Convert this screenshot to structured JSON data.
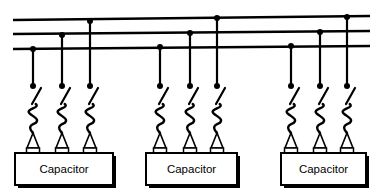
{
  "diagram": {
    "type": "electrical-schematic",
    "canvas": {
      "width": 376,
      "height": 194,
      "background": "#ffffff"
    },
    "stroke_color": "#000000",
    "fill_color": "#ffffff"
  },
  "bus": {
    "name": "three-phase-bus",
    "phase_count": 3,
    "x_start": 13,
    "x_end": 370,
    "lines": [
      {
        "label": "phase-a-line",
        "index": 0,
        "y_left": 20,
        "y_right": 16
      },
      {
        "label": "phase-b-line",
        "index": 1,
        "y_left": 34,
        "y_right": 31
      },
      {
        "label": "phase-c-line",
        "index": 2,
        "y_left": 49,
        "y_right": 46
      }
    ]
  },
  "groups": [
    {
      "id": "group-left",
      "label": "Capacitor",
      "box": {
        "x": 15,
        "y": 153,
        "width": 98,
        "height": 32,
        "shadow_offset": 3
      },
      "drops": [
        {
          "phase": "phase-c",
          "bus_index": 2,
          "x": 33,
          "bus_y": 49,
          "end_y": 86
        },
        {
          "phase": "phase-b",
          "bus_index": 1,
          "x": 62,
          "bus_y": 35,
          "end_y": 86
        },
        {
          "phase": "phase-a",
          "bus_index": 0,
          "x": 90,
          "bus_y": 21,
          "end_y": 86
        }
      ],
      "bushing_x": [
        33,
        62,
        90
      ]
    },
    {
      "id": "group-middle",
      "label": "Capacitor",
      "box": {
        "x": 146,
        "y": 153,
        "width": 91,
        "height": 32,
        "shadow_offset": 3
      },
      "drops": [
        {
          "phase": "phase-c",
          "bus_index": 2,
          "x": 160,
          "bus_y": 47,
          "end_y": 86
        },
        {
          "phase": "phase-b",
          "bus_index": 1,
          "x": 190,
          "bus_y": 33,
          "end_y": 86
        },
        {
          "phase": "phase-a",
          "bus_index": 0,
          "x": 217,
          "bus_y": 18,
          "end_y": 86
        }
      ],
      "bushing_x": [
        160,
        190,
        217
      ]
    },
    {
      "id": "group-right",
      "label": "Capacitor",
      "box": {
        "x": 281,
        "y": 153,
        "width": 85,
        "height": 32,
        "shadow_offset": 3
      },
      "drops": [
        {
          "phase": "phase-c",
          "bus_index": 2,
          "x": 291,
          "bus_y": 46,
          "end_y": 86
        },
        {
          "phase": "phase-b",
          "bus_index": 1,
          "x": 320,
          "bus_y": 32,
          "end_y": 86
        },
        {
          "phase": "phase-a",
          "bus_index": 0,
          "x": 347,
          "bus_y": 17,
          "end_y": 86
        }
      ],
      "bushing_x": [
        291,
        320,
        347
      ]
    }
  ],
  "element_geometry": {
    "node_dot_radius": 3.0,
    "terminal_dot_radius": 3.0,
    "switch_blade": {
      "dx": 9,
      "dy": -16,
      "offset_x": -1,
      "offset_y": 18
    },
    "coil": {
      "top_y": 104,
      "bottom_y": 133,
      "amplitude": 5
    },
    "insulator": {
      "half_width": 6,
      "top_y": 133,
      "base_y": 148
    },
    "bushing_pad": {
      "width": 13,
      "height": 6
    }
  },
  "labels": {
    "capacitor": "Capacitor"
  }
}
